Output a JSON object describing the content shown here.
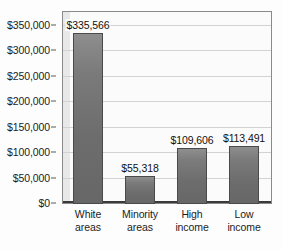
{
  "chart_data": {
    "type": "bar",
    "title": "",
    "subtitle": "",
    "xlabel": "",
    "ylabel": "",
    "categories": [
      "White areas",
      "Minority areas",
      "High income",
      "Low income"
    ],
    "category_lines": [
      [
        "White",
        "areas"
      ],
      [
        "Minority",
        "areas"
      ],
      [
        "High",
        "income"
      ],
      [
        "Low",
        "income"
      ]
    ],
    "values": [
      335566,
      55318,
      109606,
      113491
    ],
    "value_labels": [
      "$335,566",
      "$55,318",
      "$109,606",
      "$113,491"
    ],
    "ylim": [
      0,
      375000
    ],
    "ytick_values": [
      0,
      50000,
      100000,
      150000,
      200000,
      250000,
      300000,
      350000
    ],
    "ytick_labels": [
      "$0",
      "$50,000",
      "$100,000",
      "$150,000",
      "$200,000",
      "$250,000",
      "$300,000",
      "$350,000"
    ],
    "grid": true,
    "grid_axis": "y",
    "legend": false,
    "legend_position": "none",
    "colors": {
      "bar_fill_top": "#8e8e8e",
      "bar_fill_bottom": "#676767",
      "bar_border": "#4a4a4a",
      "gridline": "#d2d2d2",
      "plot_border": "#8a8a8a",
      "plot_background": "#fbfbfb",
      "axis_line": "#3a3a3a",
      "text": "#1c1c1c",
      "page_background": "#fdfdfd"
    }
  }
}
